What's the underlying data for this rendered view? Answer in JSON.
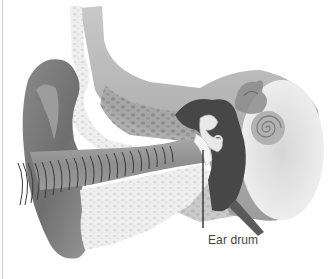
{
  "figure": {
    "palette": {
      "background": "#ffffff",
      "outer_ear_dark": "#7a7a7a",
      "outer_ear_mid": "#9e9e9e",
      "canal": "#8c8c8c",
      "bone_light": "#e6e6e6",
      "bone_texture": "#bdbdbd",
      "middle_ear_cavity": "#4a4a4a",
      "inner_ear": "#b8b8b8",
      "soundwave": "#3a3a3a",
      "label_text": "#444444",
      "pointer": "#333333"
    }
  },
  "labels": [
    {
      "id": "ear-drum",
      "text": "Ear drum"
    }
  ]
}
